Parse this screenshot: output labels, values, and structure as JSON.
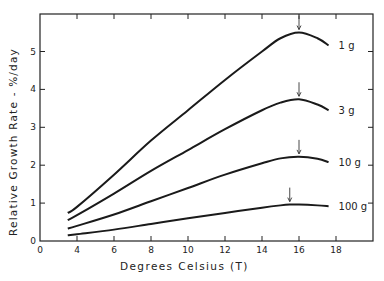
{
  "chart_data": {
    "type": "line",
    "title": "",
    "xlabel": "Degrees Celsius (T)",
    "ylabel": "Relative Growth Rate - %/day",
    "xlim": [
      0,
      20
    ],
    "ylim": [
      0,
      6
    ],
    "x_axis_break": true,
    "xticks": [
      0,
      4,
      6,
      8,
      10,
      12,
      14,
      16,
      18
    ],
    "xtick_labels": [
      "0",
      "4",
      "6",
      "8",
      "10",
      "12",
      "14",
      "16",
      "18"
    ],
    "yticks": [
      0,
      1,
      2,
      3,
      4,
      5
    ],
    "ytick_labels": [
      "0",
      "1",
      "2",
      "3",
      "4",
      "5"
    ],
    "grid": false,
    "legend": "inline labels at right end of each curve",
    "series": [
      {
        "name": "1 g",
        "x": [
          3.5,
          4,
          6,
          8,
          10,
          12,
          14,
          15,
          16,
          17,
          17.6
        ],
        "y": [
          0.74,
          0.9,
          1.75,
          2.65,
          3.45,
          4.25,
          5.0,
          5.35,
          5.5,
          5.35,
          5.16
        ],
        "peak_marker_x": 16
      },
      {
        "name": "3 g",
        "x": [
          3.5,
          4,
          6,
          8,
          10,
          12,
          14,
          15,
          16,
          17,
          17.6
        ],
        "y": [
          0.55,
          0.68,
          1.25,
          1.85,
          2.4,
          2.95,
          3.45,
          3.65,
          3.74,
          3.6,
          3.45
        ],
        "peak_marker_x": 16
      },
      {
        "name": "10 g",
        "x": [
          3.5,
          4,
          6,
          8,
          10,
          12,
          14,
          15,
          16,
          17,
          17.6
        ],
        "y": [
          0.33,
          0.4,
          0.7,
          1.05,
          1.4,
          1.75,
          2.05,
          2.18,
          2.22,
          2.17,
          2.08
        ],
        "peak_marker_x": 16
      },
      {
        "name": "100 g",
        "x": [
          3.5,
          4,
          6,
          8,
          10,
          12,
          14,
          15,
          15.5,
          16,
          17,
          17.6
        ],
        "y": [
          0.15,
          0.18,
          0.3,
          0.45,
          0.6,
          0.74,
          0.88,
          0.94,
          0.96,
          0.96,
          0.94,
          0.92
        ],
        "peak_marker_x": 15.5
      }
    ]
  }
}
